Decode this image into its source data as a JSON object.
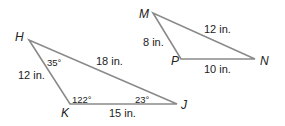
{
  "figure": {
    "stroke_color": "#8a8a8a",
    "text_color": "#222222",
    "triangle_hkj": {
      "vertices": {
        "H": "H",
        "K": "K",
        "J": "J"
      },
      "sides": {
        "HK": "12 in.",
        "HJ": "18 in.",
        "KJ": "15 in."
      },
      "angles": {
        "H": "35°",
        "K": "122°",
        "J": "23°"
      }
    },
    "triangle_mpn": {
      "vertices": {
        "M": "M",
        "P": "P",
        "N": "N"
      },
      "sides": {
        "MP": "8 in.",
        "MN": "12 in.",
        "PN": "10 in."
      }
    }
  }
}
